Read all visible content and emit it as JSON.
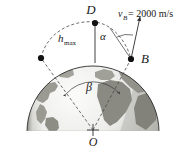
{
  "figure": {
    "background_color": "#ffffff",
    "labels": {
      "apex_point": "D",
      "launch_point": "B",
      "center_point": "O",
      "angle_alpha": "α",
      "angle_beta": "β",
      "max_height": "h",
      "max_height_sub": "max",
      "velocity_symbol": "v",
      "velocity_sub": "B",
      "velocity_value": "= 2000 m/s"
    },
    "colors": {
      "line": "#2b2b2b",
      "dashed": "#4a4a4a",
      "ocean_light": "#f2f2f0",
      "ocean_mid": "#d8d8d4",
      "land": "#9a9a93",
      "land_dark": "#7d7d76",
      "shadow": "#8e8e88",
      "marker": "#111111"
    },
    "geometry": {
      "earth_center_x": 93,
      "earth_center_y": 132,
      "earth_radius": 66,
      "clip_bottom_y": 131,
      "point_D": [
        95,
        22
      ],
      "point_B": [
        131,
        59
      ],
      "point_A": [
        41,
        58
      ],
      "velocity_tip": [
        139,
        18
      ],
      "velocity_magnitude": 2000,
      "velocity_units": "m/s"
    }
  }
}
